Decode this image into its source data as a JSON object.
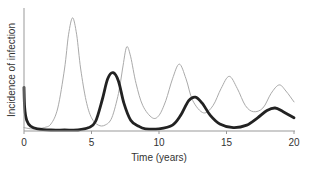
{
  "chart_data": {
    "type": "line",
    "title": "",
    "xlabel": "Time (years)",
    "ylabel": "Incidence of infection",
    "xlim": [
      0,
      20
    ],
    "ylim": [
      0,
      1
    ],
    "xticks": [
      0,
      5,
      10,
      15,
      20
    ],
    "xtick_labels": [
      "0",
      "5",
      "10",
      "15",
      "20"
    ],
    "yticks": [],
    "grid": false,
    "legend": null,
    "series": [
      {
        "name": "thin line",
        "style": "thin grey",
        "color": "#aaaaaa",
        "x": [
          0,
          0.5,
          1,
          1.5,
          2,
          2.5,
          3,
          3.3,
          3.6,
          3.9,
          4.2,
          4.6,
          5,
          5.5,
          6,
          6.5,
          7,
          7.3,
          7.6,
          7.9,
          8.3,
          8.8,
          9.5,
          10,
          10.5,
          11,
          11.5,
          12,
          12.5,
          13.3,
          14,
          14.6,
          15.2,
          15.8,
          16.4,
          17,
          17.7,
          18.3,
          18.9,
          19.4,
          20
        ],
        "values": [
          0.02,
          0.01,
          0.01,
          0.02,
          0.05,
          0.18,
          0.5,
          0.78,
          0.92,
          0.78,
          0.5,
          0.24,
          0.1,
          0.04,
          0.04,
          0.1,
          0.3,
          0.5,
          0.68,
          0.6,
          0.38,
          0.2,
          0.1,
          0.12,
          0.24,
          0.42,
          0.54,
          0.42,
          0.24,
          0.14,
          0.2,
          0.34,
          0.44,
          0.34,
          0.2,
          0.15,
          0.18,
          0.3,
          0.37,
          0.32,
          0.23
        ]
      },
      {
        "name": "thick line",
        "style": "thick black",
        "color": "#222222",
        "x": [
          0,
          0.05,
          0.2,
          0.5,
          1,
          2,
          3,
          4,
          4.8,
          5.3,
          5.8,
          6.2,
          6.6,
          7,
          7.4,
          7.9,
          8.5,
          9,
          10,
          11,
          11.6,
          12.2,
          12.7,
          13.2,
          13.8,
          14.5,
          15.5,
          16.5,
          17.3,
          18,
          18.6,
          19.2,
          20
        ],
        "values": [
          0.35,
          0.18,
          0.08,
          0.03,
          0.01,
          0.0,
          0.0,
          0.0,
          0.02,
          0.07,
          0.25,
          0.42,
          0.47,
          0.4,
          0.22,
          0.08,
          0.03,
          0.01,
          0.01,
          0.04,
          0.12,
          0.24,
          0.27,
          0.22,
          0.12,
          0.05,
          0.02,
          0.04,
          0.1,
          0.16,
          0.18,
          0.15,
          0.1
        ]
      }
    ]
  }
}
